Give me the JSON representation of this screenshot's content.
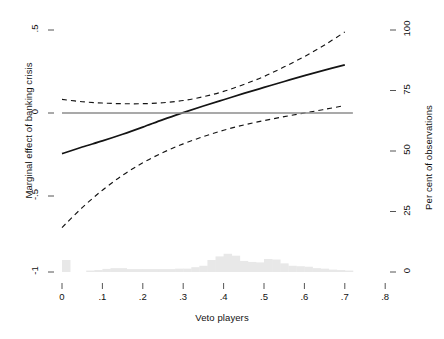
{
  "chart_data": {
    "type": "line",
    "title": "",
    "xlabel": "Veto players",
    "ylabel": "Marginal effect of banking crisis",
    "y2label": "Per cent of observations",
    "xlim": [
      -0.02,
      0.84
    ],
    "ylim": [
      -1.08,
      0.56
    ],
    "y2lim": [
      0,
      111
    ],
    "grid": false,
    "legend": null,
    "xticks": [
      "0",
      ".1",
      ".2",
      ".3",
      ".4",
      ".5",
      ".6",
      ".7",
      ".8"
    ],
    "xtick_values": [
      0,
      0.1,
      0.2,
      0.3,
      0.4,
      0.5,
      0.6,
      0.7,
      0.8
    ],
    "yticks": [
      ".5",
      "0",
      "-.5",
      "-1"
    ],
    "ytick_values": [
      0.5,
      0,
      -0.5,
      -1
    ],
    "y2ticks": [
      "100",
      "75",
      "50",
      "25",
      "0"
    ],
    "y2tick_values": [
      100,
      75,
      50,
      25,
      0
    ],
    "series": [
      {
        "name": "marginal-effect",
        "style": "solid",
        "color": "#141414",
        "x": [
          0.0,
          0.05,
          0.1,
          0.15,
          0.2,
          0.25,
          0.3,
          0.35,
          0.4,
          0.45,
          0.5,
          0.55,
          0.6,
          0.65,
          0.7
        ],
        "values": [
          -0.245,
          -0.205,
          -0.168,
          -0.128,
          -0.085,
          -0.04,
          0.002,
          0.042,
          0.08,
          0.118,
          0.154,
          0.19,
          0.225,
          0.258,
          0.29
        ]
      },
      {
        "name": "upper-confidence-bound",
        "style": "dashed",
        "color": "#141414",
        "x": [
          0.0,
          0.05,
          0.1,
          0.15,
          0.2,
          0.25,
          0.3,
          0.35,
          0.4,
          0.45,
          0.5,
          0.55,
          0.6,
          0.65,
          0.7
        ],
        "values": [
          0.082,
          0.068,
          0.06,
          0.056,
          0.056,
          0.062,
          0.075,
          0.098,
          0.13,
          0.172,
          0.22,
          0.278,
          0.34,
          0.41,
          0.488
        ]
      },
      {
        "name": "lower-confidence-bound",
        "style": "dashed",
        "color": "#141414",
        "x": [
          0.0,
          0.05,
          0.1,
          0.15,
          0.2,
          0.25,
          0.3,
          0.35,
          0.4,
          0.45,
          0.5,
          0.55,
          0.6,
          0.65,
          0.7
        ],
        "values": [
          -0.69,
          -0.57,
          -0.465,
          -0.375,
          -0.3,
          -0.238,
          -0.186,
          -0.142,
          -0.104,
          -0.072,
          -0.046,
          -0.022,
          0.0,
          0.022,
          0.045
        ]
      },
      {
        "name": "zero-reference-line",
        "style": "solid",
        "color": "#8c8c8c",
        "x": [
          0.0,
          0.72
        ],
        "values": [
          0.0,
          0.0
        ]
      }
    ],
    "histogram": {
      "name": "observation-distribution",
      "color": "#e8e8e8",
      "bin_width": 0.02,
      "bin_starts": [
        0.0,
        0.02,
        0.04,
        0.06,
        0.08,
        0.1,
        0.12,
        0.14,
        0.16,
        0.18,
        0.2,
        0.22,
        0.24,
        0.26,
        0.28,
        0.3,
        0.32,
        0.34,
        0.36,
        0.38,
        0.4,
        0.42,
        0.44,
        0.46,
        0.48,
        0.5,
        0.52,
        0.54,
        0.56,
        0.58,
        0.6,
        0.62,
        0.64,
        0.66,
        0.68,
        0.7
      ],
      "values": [
        5.0,
        0.0,
        0.0,
        0.6,
        0.8,
        1.3,
        1.6,
        1.6,
        1.2,
        1.2,
        1.2,
        1.2,
        1.2,
        1.2,
        1.4,
        1.4,
        2.0,
        2.6,
        5.0,
        6.5,
        7.6,
        6.8,
        4.6,
        4.2,
        4.0,
        5.4,
        5.2,
        3.6,
        2.6,
        2.4,
        2.2,
        1.6,
        1.4,
        1.0,
        0.8,
        0.6
      ]
    }
  },
  "labels": {
    "x_title": "Veto players",
    "y_left_title": "Marginal effect of banking crisis",
    "y_right_title": "Per cent of observations",
    "x_ticks": [
      "0",
      ".1",
      ".2",
      ".3",
      ".4",
      ".5",
      ".6",
      ".7",
      ".8"
    ],
    "y_left_ticks": [
      ".5",
      "0",
      "-.5",
      "-1"
    ],
    "y_right_ticks": [
      "100",
      "75",
      "50",
      "25",
      "0"
    ]
  },
  "colors": {
    "line": "#141414",
    "reference": "#8c8c8c",
    "histogram": "#e8e8e8",
    "background": "#ffffff",
    "text": "#111111"
  }
}
